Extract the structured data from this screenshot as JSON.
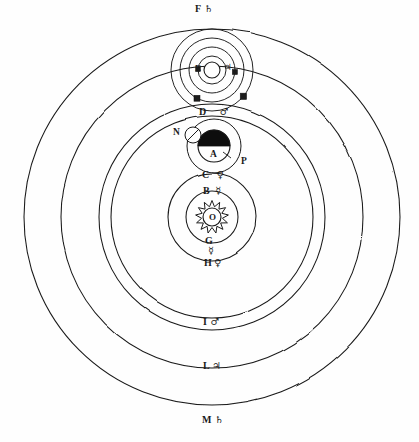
{
  "figure": {
    "center_label": "O",
    "ink_color": "#1a1a1a",
    "paper_color": "#fefefe"
  },
  "center": {
    "x": 212,
    "y": 217
  },
  "orbits": [
    {
      "key": "mercury_inner",
      "letter": "B",
      "symbol": "☿",
      "radius": 26,
      "label_x": 198,
      "label_y": 193,
      "label_pos": "top"
    },
    {
      "key": "venus",
      "letter": "C",
      "symbol": "♀",
      "radius": 44,
      "label_x": 200,
      "label_y": 176,
      "label_pos": "top"
    },
    {
      "key": "earth",
      "letter": "D",
      "symbol": "♂",
      "radius": 101,
      "label_x": 200,
      "label_y": 112,
      "label_pos": "top"
    },
    {
      "key": "mars",
      "letter": "I",
      "symbol": "♂",
      "radius": 113,
      "label_x": 200,
      "label_y": 320,
      "label_pos": "bottom"
    },
    {
      "key": "jupiter",
      "letter": "L",
      "symbol": "♃",
      "radius": 151,
      "label_x": 200,
      "label_y": 364,
      "label_pos": "bottom"
    },
    {
      "key": "saturn",
      "letter": "M",
      "symbol": "♄",
      "radius": 188,
      "label_x": 200,
      "label_y": 415,
      "label_pos": "bottom"
    },
    {
      "key": "saturn_outer",
      "letter": "F",
      "symbol": "♄",
      "radius": 188,
      "label_x": 200,
      "label_y": 10,
      "label_pos": "top"
    }
  ],
  "ring_labels": [
    {
      "name": "saturn-ring-top",
      "letter": "F",
      "symbol": "♄",
      "x": 195,
      "y": 9
    },
    {
      "name": "earth-ring-top",
      "letter": "D",
      "symbol": "♂",
      "x": 199,
      "y": 112
    },
    {
      "name": "venus-ring-top",
      "letter": "C",
      "symbol": "♀",
      "x": 202,
      "y": 175
    },
    {
      "name": "mercury-ring-top",
      "letter": "B",
      "symbol": "☿",
      "x": 203,
      "y": 191
    },
    {
      "name": "mercury-ring-bottom",
      "letter": "G",
      "symbol": "☿",
      "x": 205,
      "y": 240
    },
    {
      "name": "venus-ring-bottom",
      "letter": "H",
      "symbol": "♀",
      "x": 204,
      "y": 262
    },
    {
      "name": "mars-ring-bottom",
      "letter": "I",
      "symbol": "♂",
      "x": 203,
      "y": 321
    },
    {
      "name": "jupiter-ring-bottom",
      "letter": "L",
      "symbol": "♃",
      "x": 203,
      "y": 365
    },
    {
      "name": "saturn-ring-bottom",
      "letter": "M",
      "symbol": "♄",
      "x": 202,
      "y": 419
    }
  ],
  "bodies": {
    "sun": {
      "label": "O",
      "x": 212,
      "y": 217,
      "radius": 9,
      "name": "sun"
    },
    "earth": {
      "label": "A",
      "x": 214,
      "y": 146,
      "radius": 16,
      "name": "earth"
    },
    "moon": {
      "label": "N",
      "x": 193,
      "y": 135,
      "radius": 8,
      "label_x": 173,
      "label_y": 128,
      "name": "moon"
    },
    "lunar_orbit": {
      "label": "P",
      "label_x": 236,
      "label_y": 160,
      "radius": 27,
      "name": "lunar-orbit"
    },
    "jupiter": {
      "letter": "E",
      "symbol": "♃",
      "x": 212,
      "y": 70,
      "radius": 8,
      "name": "jupiter"
    }
  },
  "jupiter_moons": [
    {
      "name": "io",
      "orbit_radius": 14,
      "angle_deg": 183,
      "size": 2.4
    },
    {
      "name": "europa",
      "orbit_radius": 23,
      "angle_deg": 5,
      "size": 2.6
    },
    {
      "name": "ganymede",
      "orbit_radius": 32,
      "angle_deg": 118,
      "size": 3.0
    },
    {
      "name": "callisto",
      "orbit_radius": 41,
      "angle_deg": 40,
      "size": 3.2
    }
  ],
  "jupiter_orbit_rings": [
    14,
    23,
    32,
    41
  ],
  "legend": {
    "O": "Sun",
    "A": "Earth",
    "N": "Moon",
    "P": "Lunar orbit",
    "B": "Mercury orbit (upper)",
    "C": "Venus orbit (upper)",
    "D": "Earth orbit (upper)",
    "E": "Jupiter",
    "F": "Saturn orbit (upper)",
    "G": "Mercury orbit (lower)",
    "H": "Venus orbit (lower)",
    "I": "Mars orbit (lower)",
    "L": "Jupiter orbit (lower)",
    "M": "Saturn orbit (lower)"
  }
}
